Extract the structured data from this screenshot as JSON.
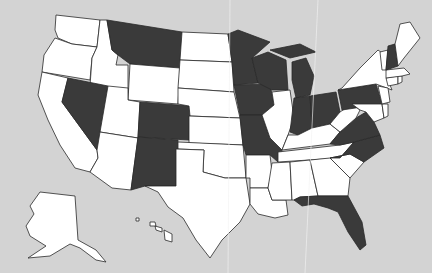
{
  "map": {
    "title": "United States",
    "colors": {
      "background": "#d3d3d3",
      "highlighted": "#3a3a3a",
      "default": "#ffffff",
      "border": "#2a2a2a"
    },
    "highlighted_states": [
      "MT",
      "NV",
      "CO",
      "NM",
      "MN",
      "WI",
      "IA",
      "MO",
      "MI",
      "IN",
      "OH",
      "PA",
      "NH",
      "VA",
      "NC",
      "FL"
    ],
    "states": [
      {
        "id": "WA",
        "d": "M56,15 L100,20 L97,47 L72,44 L58,38 L55,30 Z"
      },
      {
        "id": "OR",
        "d": "M55,38 L72,44 L97,47 L92,58 L90,80 L42,72 L44,55 Z"
      },
      {
        "id": "CA",
        "d": "M42,72 L68,78 L62,102 L97,150 L98,158 L90,172 L75,168 L60,145 L48,120 L38,95 Z"
      },
      {
        "id": "ID",
        "d": "M100,20 L107,20 L112,50 L118,55 L116,65 L128,65 L128,93 L90,86 L92,58 L97,47 Z"
      },
      {
        "id": "NV",
        "d": "M68,78 L108,86 L100,140 L97,150 L62,102 Z"
      },
      {
        "id": "MT",
        "d": "M107,20 L182,32 L180,68 L130,64 L118,55 L112,50 Z"
      },
      {
        "id": "WY",
        "d": "M130,64 L180,68 L178,104 L128,100 Z"
      },
      {
        "id": "UT",
        "d": "M108,86 L128,88 L128,100 L140,102 L138,138 L100,132 Z"
      },
      {
        "id": "CO",
        "d": "M140,102 L190,106 L189,140 L138,137 Z"
      },
      {
        "id": "AZ",
        "d": "M100,132 L138,138 L131,190 L112,188 L90,172 L98,158 L97,150 Z"
      },
      {
        "id": "NM",
        "d": "M138,137 L178,140 L176,186 L145,186 L131,190 Z"
      },
      {
        "id": "ND",
        "d": "M182,32 L228,34 L232,62 L180,60 Z"
      },
      {
        "id": "SD",
        "d": "M180,60 L232,62 L234,92 L178,88 Z"
      },
      {
        "id": "NE",
        "d": "M178,88 L234,92 L240,118 L190,116 L189,106 L178,104 Z"
      },
      {
        "id": "KS",
        "d": "M189,116 L240,118 L243,145 L189,143 Z"
      },
      {
        "id": "OK",
        "d": "M178,142 L243,145 L246,178 L225,178 L203,172 L204,150 L178,149 Z"
      },
      {
        "id": "TX",
        "d": "M176,149 L204,150 L203,172 L225,178 L246,178 L250,204 L240,222 L222,240 L210,258 L196,240 L183,218 L168,207 L158,192 L145,186 L176,186 Z"
      },
      {
        "id": "MN",
        "d": "M228,34 L238,30 L270,42 L252,58 L258,83 L234,85 L232,62 Z"
      },
      {
        "id": "IA",
        "d": "M234,85 L270,84 L274,105 L262,115 L240,115 Z"
      },
      {
        "id": "MO",
        "d": "M240,115 L262,115 L270,138 L282,150 L278,162 L270,155 L246,155 L243,145 Z"
      },
      {
        "id": "AR",
        "d": "M246,155 L270,155 L272,172 L268,188 L250,188 L250,178 L246,178 Z"
      },
      {
        "id": "LA",
        "d": "M250,188 L268,188 L272,200 L286,200 L288,215 L275,218 L258,214 L250,204 Z"
      },
      {
        "id": "WI",
        "d": "M252,58 L268,52 L286,60 L288,90 L272,90 L258,83 Z"
      },
      {
        "id": "IL",
        "d": "M272,92 L290,90 L294,118 L288,135 L282,150 L270,138 L262,115 L274,105 Z"
      },
      {
        "id": "MI",
        "d": "M292,62 L306,58 L314,76 L310,95 L296,98 L292,80 Z M270,50 L300,44 L316,52 L290,58 Z"
      },
      {
        "id": "IN",
        "d": "M294,98 L310,96 L312,128 L298,135 L290,132 Z"
      },
      {
        "id": "OH",
        "d": "M310,96 L336,92 L340,112 L330,124 L312,128 Z"
      },
      {
        "id": "KY",
        "d": "M288,135 L298,135 L312,128 L330,124 L340,132 L330,144 L282,150 Z"
      },
      {
        "id": "TN",
        "d": "M278,152 L340,145 L354,142 L340,158 L278,162 Z"
      },
      {
        "id": "MS",
        "d": "M272,163 L290,162 L292,200 L286,200 L272,200 L268,188 Z"
      },
      {
        "id": "AL",
        "d": "M290,162 L310,160 L318,196 L300,197 L294,200 L292,200 Z"
      },
      {
        "id": "GA",
        "d": "M310,160 L330,158 L350,178 L348,196 L318,196 Z"
      },
      {
        "id": "FL",
        "d": "M294,200 L300,197 L318,196 L348,196 L362,222 L366,245 L360,250 L348,232 L338,212 L328,208 L314,204 L302,206 Z"
      },
      {
        "id": "SC",
        "d": "M330,158 L350,154 L364,162 L350,178 Z"
      },
      {
        "id": "NC",
        "d": "M340,158 L354,142 L380,135 L384,148 L364,162 L350,154 L330,158 Z"
      },
      {
        "id": "VA",
        "d": "M330,144 L340,132 L356,118 L366,112 L374,122 L380,135 L354,142 L340,145 Z"
      },
      {
        "id": "WV",
        "d": "M330,124 L340,112 L352,104 L360,110 L356,118 L340,132 Z"
      },
      {
        "id": "PA",
        "d": "M338,90 L376,84 L382,104 L342,110 Z"
      },
      {
        "id": "NY",
        "d": "M342,88 L360,68 L378,50 L386,56 L388,80 L392,90 L376,84 L338,90 Z"
      },
      {
        "id": "MD",
        "d": "M352,104 L382,104 L384,118 L374,122 L366,112 L360,110 Z"
      },
      {
        "id": "DE",
        "d": "M382,104 L388,104 L388,116 L384,118 Z"
      },
      {
        "id": "NJ",
        "d": "M378,86 L388,88 L390,102 L382,104 Z"
      },
      {
        "id": "CT",
        "d": "M386,78 L398,76 L398,84 L388,86 Z"
      },
      {
        "id": "RI",
        "d": "M398,76 L402,76 L402,82 L398,84 Z"
      },
      {
        "id": "MA",
        "d": "M386,70 L404,68 L410,74 L402,76 L386,78 Z"
      },
      {
        "id": "VT",
        "d": "M380,52 L388,50 L386,70 L382,70 Z"
      },
      {
        "id": "NH",
        "d": "M388,46 L395,44 L398,66 L386,70 Z"
      },
      {
        "id": "ME",
        "d": "M395,44 L400,24 L410,22 L420,38 L404,58 L398,66 Z"
      },
      {
        "id": "AK",
        "d": "M40,192 L75,196 L78,240 L96,250 L106,262 L96,260 L80,248 L70,244 L50,256 L28,258 L46,246 L30,236 L26,226 L34,214 L30,206 Z"
      },
      {
        "id": "HI",
        "d": "M136,218 L139,218 L139,221 L136,221 Z M150,222 L155,222 L156,226 L150,226 Z M155,226 L162,228 L162,232 L156,230 Z M164,230 L172,234 L172,242 L165,240 Z"
      }
    ],
    "creases": [
      {
        "d": "M230,0 L228,273"
      },
      {
        "d": "M318,0 L305,273"
      }
    ]
  }
}
